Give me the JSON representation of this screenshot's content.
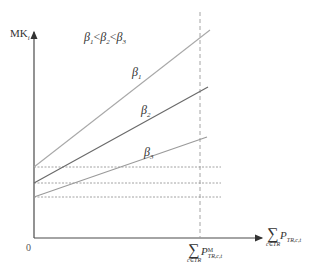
{
  "diagram": {
    "y_axis_label": {
      "main": "MK",
      "sub": "i"
    },
    "origin_label": "0",
    "condition_label": {
      "b1": "β",
      "s1": "1",
      "lt1": "<",
      "b2": "β",
      "s2": "2",
      "lt2": "<",
      "b3": "β",
      "s3": "3"
    },
    "lines": [
      {
        "name": "β",
        "sub": "1",
        "start": [
          34,
          167
        ],
        "end": [
          210,
          30
        ]
      },
      {
        "name": "β",
        "sub": "2",
        "start": [
          34,
          183
        ],
        "end": [
          208,
          87
        ]
      },
      {
        "name": "β",
        "sub": "3",
        "start": [
          34,
          197
        ],
        "end": [
          207,
          137
        ]
      }
    ],
    "x_axis_label": {
      "sigma": "∑",
      "under": "c∈TR",
      "main": "P",
      "sub": "TR,c,t"
    },
    "marker_label": {
      "sigma": "∑",
      "under": "c∈TR",
      "main": "P",
      "sup": "M",
      "sub": "TR,c,t"
    },
    "colors": {
      "axis": "#4a4a4a",
      "beta1": "#a8a8a8",
      "beta2": "#6a6a6a",
      "beta3": "#9a9a9a",
      "dashed": "#9a9a9a"
    }
  }
}
